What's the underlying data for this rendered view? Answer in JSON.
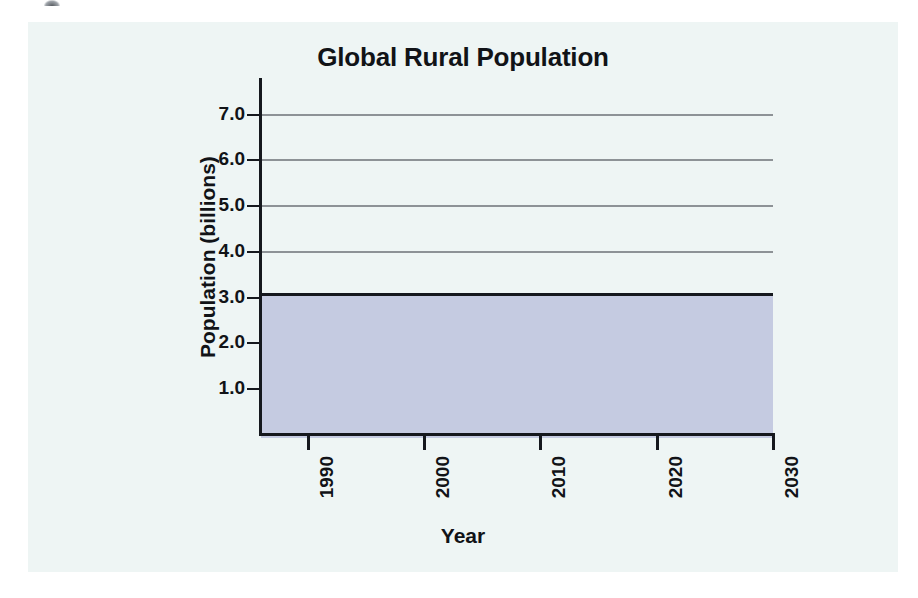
{
  "chart_data": {
    "type": "area",
    "title": "Global Rural Population",
    "xlabel": "Year",
    "ylabel": "Population (billions)",
    "x": [
      1990,
      2000,
      2010,
      2020,
      2030
    ],
    "values": [
      3.1,
      3.1,
      3.1,
      3.1,
      3.1
    ],
    "series": [
      {
        "name": "Global Rural Population",
        "values": [
          3.1,
          3.1,
          3.1,
          3.1,
          3.1
        ]
      }
    ],
    "xtick_labels": [
      "1990",
      "2000",
      "2010",
      "2020",
      "2030"
    ],
    "ytick_labels": [
      "1.0",
      "2.0",
      "3.0",
      "4.0",
      "5.0",
      "6.0",
      "7.0"
    ],
    "ytick_values": [
      1.0,
      2.0,
      3.0,
      4.0,
      5.0,
      6.0,
      7.0
    ],
    "xlim": [
      1986,
      2030
    ],
    "ylim": [
      0,
      7.8
    ],
    "grid": true,
    "legend": "none",
    "fill_color": "#c5cbe1",
    "line_color": "#15181d",
    "grid_color": "#8d9296",
    "plot_background": "#eef5f4",
    "page_background": "#ffffff"
  }
}
